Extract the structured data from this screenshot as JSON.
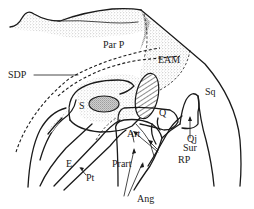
{
  "figure": {
    "type": "anatomical line drawing",
    "colors": {
      "ink": "#1a1a1a",
      "stipple": "#6a6a6a",
      "background": "#ffffff"
    },
    "labels": {
      "par_p": "Par P",
      "eam": "EAM",
      "sdp": "SDP",
      "s": "S",
      "sq": "Sq",
      "q": "Q",
      "qj": "Qj",
      "art": "Art",
      "sur": "Sur",
      "rp": "RP",
      "prart": "Prart",
      "e": "E",
      "pt": "Pt",
      "ang": "Ang"
    }
  }
}
